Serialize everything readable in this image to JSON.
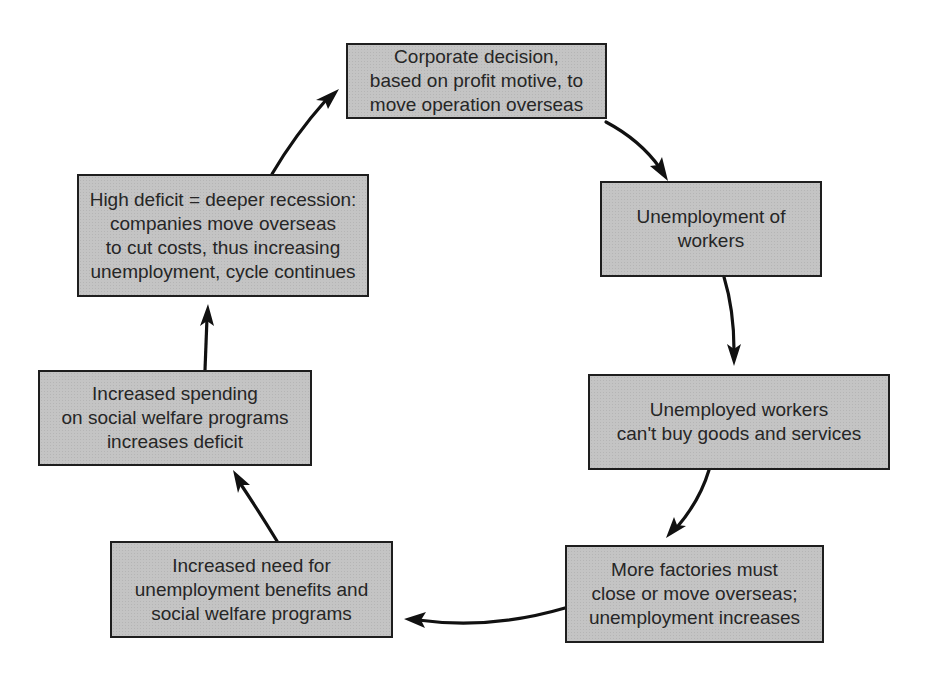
{
  "diagram": {
    "type": "cycle",
    "background_color": "#ffffff",
    "box_fill_color": "#c4c4c4",
    "border_color": "#1e1e1e",
    "nodes": [
      {
        "id": "corporate-decision",
        "lines": [
          "Corporate decision,",
          "based on profit motive, to",
          "move operation overseas"
        ]
      },
      {
        "id": "unemployment-of-workers",
        "lines": [
          "Unemployment of",
          "workers"
        ]
      },
      {
        "id": "cant-buy-goods",
        "lines": [
          "Unemployed workers",
          "can't buy goods and services"
        ]
      },
      {
        "id": "more-factories-close",
        "lines": [
          "More factories must",
          "close or move overseas;",
          "unemployment increases"
        ]
      },
      {
        "id": "increased-need-benefits",
        "lines": [
          "Increased need for",
          "unemployment benefits and",
          "social welfare programs"
        ]
      },
      {
        "id": "increased-spending",
        "lines": [
          "Increased spending",
          "on social welfare programs",
          "increases deficit"
        ]
      },
      {
        "id": "high-deficit",
        "lines": [
          "High deficit = deeper recession:",
          "companies move overseas",
          "to cut costs, thus increasing",
          "unemployment, cycle continues"
        ]
      }
    ],
    "edges": [
      {
        "from": "corporate-decision",
        "to": "unemployment-of-workers"
      },
      {
        "from": "unemployment-of-workers",
        "to": "cant-buy-goods"
      },
      {
        "from": "cant-buy-goods",
        "to": "more-factories-close"
      },
      {
        "from": "more-factories-close",
        "to": "increased-need-benefits"
      },
      {
        "from": "increased-need-benefits",
        "to": "increased-spending"
      },
      {
        "from": "increased-spending",
        "to": "high-deficit"
      },
      {
        "from": "high-deficit",
        "to": "corporate-decision"
      }
    ]
  }
}
